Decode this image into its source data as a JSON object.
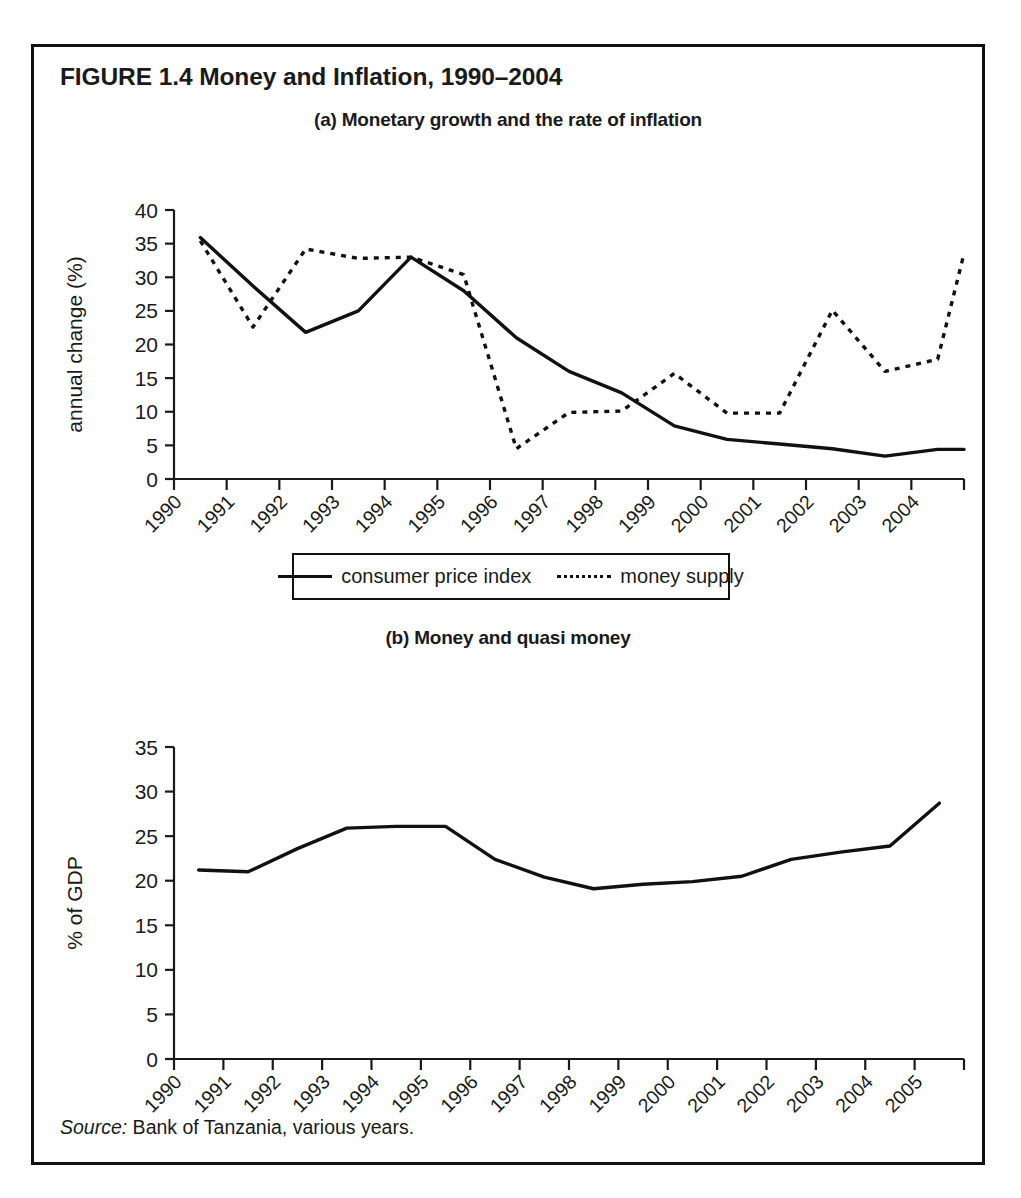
{
  "figure": {
    "title": "FIGURE 1.4  Money and Inflation, 1990–2004",
    "source_label": "Source:",
    "source_text": " Bank of Tanzania, various years.",
    "border_color": "#111111"
  },
  "legend": {
    "consumer_price_index": "consumer price index",
    "money_supply": "money supply"
  },
  "chart_data": [
    {
      "id": "panel-a",
      "type": "line",
      "title": "(a) Monetary growth and the rate of inflation",
      "xlabel": "year",
      "ylabel": "annual change (%)",
      "ylim": [
        0,
        40
      ],
      "yticks": [
        0,
        5,
        10,
        15,
        20,
        25,
        30,
        35,
        40
      ],
      "ytick_labels": [
        "0",
        "5",
        "10",
        "15",
        "20",
        "25",
        "30",
        "35",
        "40"
      ],
      "categories": [
        "1990",
        "1991",
        "1992",
        "1993",
        "1994",
        "1995",
        "1996",
        "1997",
        "1998",
        "1999",
        "2000",
        "2001",
        "2002",
        "2003",
        "2004"
      ],
      "grid": false,
      "legend_position": "below",
      "series": [
        {
          "name": "consumer price index",
          "style": "solid",
          "values": [
            35.9,
            28.7,
            21.8,
            25.0,
            33.0,
            28.0,
            21.0,
            16.0,
            12.8,
            7.9,
            5.9,
            5.2,
            4.5,
            3.4,
            4.4
          ]
        },
        {
          "name": "money supply",
          "style": "dotted",
          "values": [
            35.4,
            22.6,
            34.2,
            32.8,
            33.0,
            30.4,
            4.5,
            9.9,
            10.1,
            15.7,
            9.8,
            9.8,
            25.1,
            16.0,
            17.8
          ]
        }
      ],
      "series_extension": {
        "note": "both series continue to the right of the 2004 tick",
        "consumer_price_index_end": 4.4,
        "money_supply_end": 33.5
      }
    },
    {
      "id": "panel-b",
      "type": "line",
      "title": "(b) Money and quasi money",
      "xlabel": "year",
      "ylabel": "% of GDP",
      "ylim": [
        0,
        35
      ],
      "yticks": [
        0,
        5,
        10,
        15,
        20,
        25,
        30,
        35
      ],
      "ytick_labels": [
        "0",
        "5",
        "10",
        "15",
        "20",
        "25",
        "30",
        "35"
      ],
      "categories": [
        "1990",
        "1991",
        "1992",
        "1993",
        "1994",
        "1995",
        "1996",
        "1997",
        "1998",
        "1999",
        "2000",
        "2001",
        "2002",
        "2003",
        "2004",
        "2005"
      ],
      "grid": false,
      "legend_position": "none",
      "series": [
        {
          "name": "money and quasi money",
          "style": "solid",
          "values": [
            21.2,
            21.0,
            23.6,
            25.9,
            26.1,
            26.1,
            22.4,
            20.4,
            19.1,
            19.6,
            19.9,
            20.5,
            22.4,
            23.2,
            23.9,
            28.7
          ]
        }
      ]
    }
  ]
}
